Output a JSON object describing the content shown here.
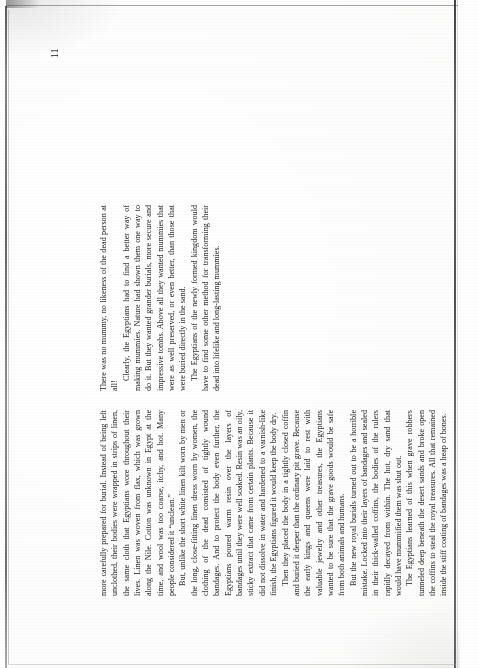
{
  "document": {
    "type": "scanned-book-page",
    "orientation": "rotated-90-ccw",
    "folio": "11",
    "background_color": "#fefefe",
    "ink_color": "#1e1e1e",
    "edge_color": "#3a3a3a"
  },
  "page": {
    "columns": [
      {
        "name": "left-column",
        "paragraphs": [
          "more carefully prepared for burial. Instead of being left unclothed, their bodies were wrapped in strips of linen, the same cloth that Egyptians wore throughout their lives. Linen was woven from flax, which was grown along the Nile. Cotton was unknown in Egypt at the time, and wool was too coarse, itchy, and hot. Many people considered it “unclean.”",
          "But, unlike the short white linen kilt worn by men or the long, close-fitting linen dress worn by women, the clothing of the dead consisted of tightly wound bandages. And to protect the body even further, the Egyptians poured warm resin over the layers of bandages until they were well soaked. Resin was an oily, sticky extract that came from certain plants. Because it did not dissolve in water and hardened to a varnish-like finish, the Egyptians figured it would keep the body dry.",
          "Then they placed the body in a tightly closed coffin and buried it deeper than the ordinary pit grave. Because the early kings and queens were laid to rest with valuable jewelry and other treasures, the Egyptians wanted to be sure that the grave goods would be safe from both animals and humans.",
          "But the new royal burials turned out to be a horrible mistake. Locked into their layers of bandages and sealed in their thick-walled coffins, the bodies of the rulers rapidly decayed from within. The hot, dry sand that would have mummified them was shut out.",
          "The Egyptians learned of this when grave robbers tunneled deep beneath the desert sands and broke open the coffins to steal the royal treasures. All that remained inside the stiff coating of bandages was a heap of bones."
        ]
      },
      {
        "name": "right-column",
        "paragraphs": [
          "There was no mummy, no likeness of the dead person at all!",
          "Clearly, the Egyptians had to find a better way of making mummies. Nature had shown them one way to do it. But they wanted grander burials, more secure and impressive tombs. Above all they wanted mummies that were as well preserved, or even better, than those that were buried directly in the sand.",
          "The Egyptians of the newly formed kingdom would have to find some other method for transforming their dead into lifelike and long-lasting mummies."
        ]
      }
    ]
  }
}
